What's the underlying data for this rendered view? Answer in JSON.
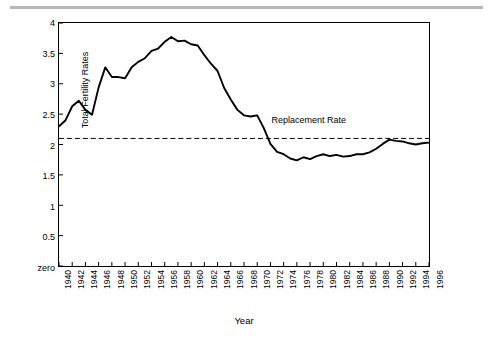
{
  "chart_data": {
    "type": "line",
    "title": "",
    "xlabel": "Year",
    "ylabel": "Total Fertility Rates",
    "xlim": [
      1940,
      1996
    ],
    "ylim": [
      0,
      4
    ],
    "ytick_labels": [
      "zero",
      "0.5",
      "1",
      "1.5",
      "2",
      "2.5",
      "3",
      "3.5",
      "4"
    ],
    "ytick_values": [
      0,
      0.5,
      1,
      1.5,
      2,
      2.5,
      3,
      3.5,
      4
    ],
    "xtick_labels": [
      "1940",
      "1942",
      "1944",
      "1946",
      "1948",
      "1950",
      "1952",
      "1954",
      "1956",
      "1958",
      "1960",
      "1962",
      "1964",
      "1966",
      "1968",
      "1970",
      "1972",
      "1974",
      "1976",
      "1978",
      "1980",
      "1982",
      "1984",
      "1986",
      "1988",
      "1990",
      "1992",
      "1994",
      "1996"
    ],
    "grid": false,
    "legend": "none",
    "annotations": [
      {
        "name": "replacement-rate-label",
        "text": "Replacement Rate",
        "x": 1972,
        "y": 2.38
      }
    ],
    "reference_lines": [
      {
        "name": "replacement-rate-line",
        "y": 2.1,
        "style": "dashed",
        "color": "#000000"
      }
    ],
    "series": [
      {
        "name": "Total Fertility Rate",
        "color": "#000000",
        "x": [
          1940,
          1941,
          1942,
          1943,
          1944,
          1945,
          1946,
          1947,
          1948,
          1949,
          1950,
          1951,
          1952,
          1953,
          1954,
          1955,
          1956,
          1957,
          1958,
          1959,
          1960,
          1961,
          1962,
          1963,
          1964,
          1965,
          1966,
          1967,
          1968,
          1969,
          1970,
          1971,
          1972,
          1973,
          1974,
          1975,
          1976,
          1977,
          1978,
          1979,
          1980,
          1981,
          1982,
          1983,
          1984,
          1985,
          1986,
          1987,
          1988,
          1989,
          1990,
          1991,
          1992,
          1993,
          1994,
          1995,
          1996
        ],
        "values": [
          2.3,
          2.4,
          2.63,
          2.72,
          2.57,
          2.49,
          2.94,
          3.27,
          3.11,
          3.11,
          3.09,
          3.27,
          3.36,
          3.42,
          3.54,
          3.58,
          3.69,
          3.77,
          3.7,
          3.71,
          3.65,
          3.63,
          3.47,
          3.33,
          3.21,
          2.93,
          2.74,
          2.57,
          2.48,
          2.46,
          2.48,
          2.27,
          2.01,
          1.88,
          1.84,
          1.77,
          1.74,
          1.79,
          1.76,
          1.81,
          1.84,
          1.81,
          1.83,
          1.8,
          1.81,
          1.84,
          1.84,
          1.87,
          1.93,
          2.01,
          2.08,
          2.06,
          2.05,
          2.02,
          2.0,
          2.02,
          2.03
        ]
      }
    ]
  },
  "labels": {
    "ylabel": "Total Fertility Rates",
    "xlabel": "Year",
    "replacement": "Replacement Rate"
  }
}
